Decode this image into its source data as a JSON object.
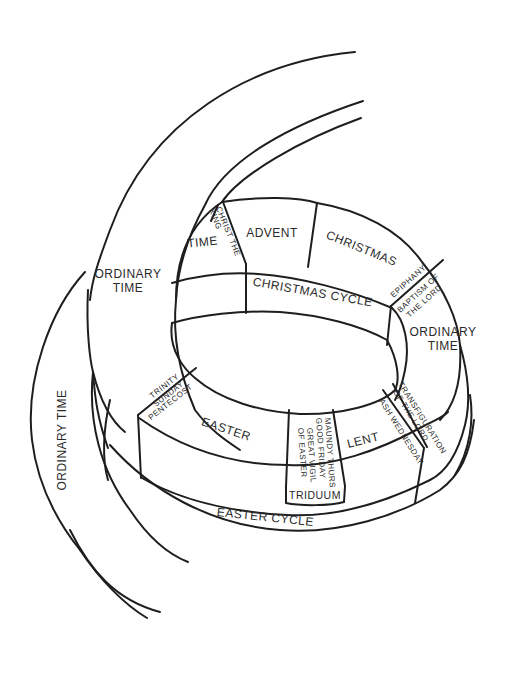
{
  "diagram": {
    "type": "liturgical-year-spiral",
    "stroke_color": "#1e1e1e",
    "text_color": "#2a2a2a",
    "background": "#ffffff"
  },
  "labels": {
    "ordinary_time_outer": "ORDINARY TIME",
    "ordinary_time_top_1": "ORDINARY",
    "ordinary_time_top_2": "TIME",
    "time_after_christ_king": "TIME",
    "christ_the_king_1": "CHRIST THE",
    "christ_the_king_2": "KING",
    "advent": "ADVENT",
    "christmas": "CHRISTMAS",
    "christmas_cycle": "CHRISTMAS CYCLE",
    "epiphany": "EPIPHANY",
    "baptism_1": "BAPTISM OF",
    "baptism_2": "THE LORD",
    "ordinary_time_right_1": "ORDINARY",
    "ordinary_time_right_2": "TIME",
    "trinity_1": "TRINITY",
    "trinity_2": "SUNDAY",
    "pentecost": "PENTECOST",
    "easter": "EASTER",
    "maundy_thurs": "MAUNDY THURS",
    "good_friday": "GOOD FRIDAY",
    "great_vigil_1": "GREAT VIGIL",
    "great_vigil_2": "OF EASTER",
    "lent": "LENT",
    "ash_wednesday": "ASH WEDNESDAY",
    "transfiguration_1": "TRANSFIGURATION",
    "transfiguration_2": "OF THE LORD",
    "triduum": "TRIDUUM",
    "easter_cycle": "EASTER CYCLE"
  }
}
